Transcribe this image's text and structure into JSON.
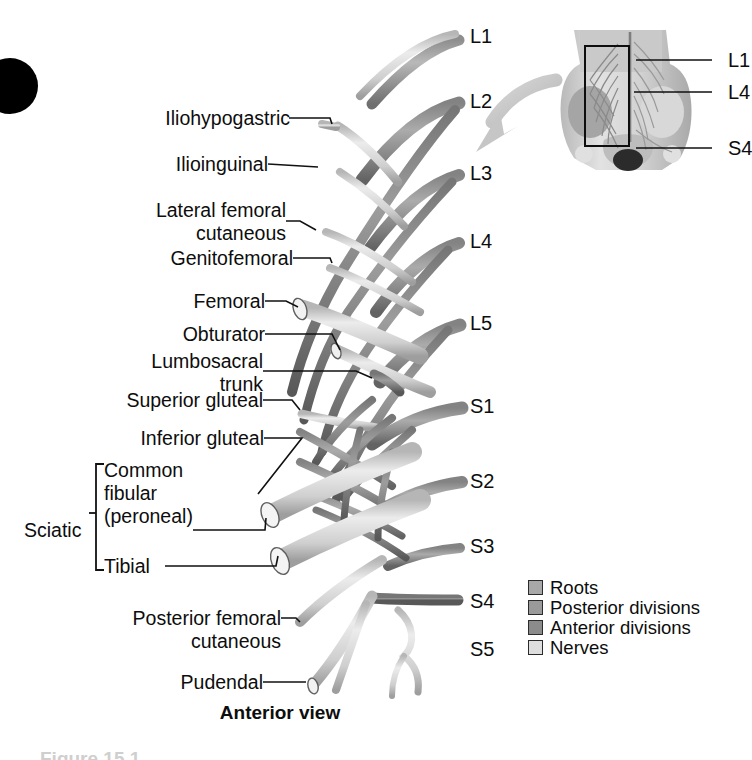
{
  "figure": {
    "view_label": "Anterior view",
    "caption_partial": "Figure 15.1",
    "corner_marker": "black-dot"
  },
  "nerve_labels": [
    {
      "id": "iliohypogastric",
      "text": "Iliohypogastric",
      "x": 142,
      "y": 118,
      "w": 160,
      "lines": 1
    },
    {
      "id": "ilioinguinal",
      "text": "Ilioinguinal",
      "x": 142,
      "y": 164,
      "w": 160,
      "lines": 1
    },
    {
      "id": "lateral-femoral-cutaneous",
      "text": "Lateral femoral\ncutaneous",
      "x": 110,
      "y": 210,
      "w": 192,
      "lines": 2
    },
    {
      "id": "genitofemoral",
      "text": "Genitofemoral",
      "x": 122,
      "y": 258,
      "w": 180,
      "lines": 1
    },
    {
      "id": "femoral",
      "text": "Femoral",
      "x": 130,
      "y": 301,
      "w": 142,
      "lines": 1
    },
    {
      "id": "obturator",
      "text": "Obturator",
      "x": 122,
      "y": 334,
      "w": 150,
      "lines": 1
    },
    {
      "id": "lumbosacral-trunk",
      "text": "Lumbosacral\ntrunk",
      "x": 108,
      "y": 361,
      "w": 164,
      "lines": 2
    },
    {
      "id": "superior-gluteal",
      "text": "Superior gluteal",
      "x": 82,
      "y": 400,
      "w": 190,
      "lines": 1
    },
    {
      "id": "inferior-gluteal",
      "text": "Inferior gluteal",
      "x": 88,
      "y": 438,
      "w": 184,
      "lines": 1
    },
    {
      "id": "common-fibular-peroneal",
      "text": "Common\nfibular\n(peroneal)",
      "x": 104,
      "y": 470,
      "w": 120,
      "lines": 3
    },
    {
      "id": "sciatic",
      "text": "Sciatic",
      "x": 30,
      "y": 513,
      "w": 66,
      "lines": 1
    },
    {
      "id": "tibial",
      "text": "Tibial",
      "x": 104,
      "y": 551,
      "w": 70,
      "lines": 1
    },
    {
      "id": "posterior-femoral-cutaneous",
      "text": "Posterior femoral\ncutaneous",
      "x": 78,
      "y": 610,
      "w": 208,
      "lines": 2
    },
    {
      "id": "pudendal",
      "text": "Pudendal",
      "x": 130,
      "y": 682,
      "w": 142,
      "lines": 1
    }
  ],
  "spinal_levels": [
    {
      "id": "L1",
      "text": "L1",
      "x": 470,
      "y": 25
    },
    {
      "id": "L2",
      "text": "L2",
      "x": 470,
      "y": 90
    },
    {
      "id": "L3",
      "text": "L3",
      "x": 470,
      "y": 162
    },
    {
      "id": "L4",
      "text": "L4",
      "x": 470,
      "y": 230
    },
    {
      "id": "L5",
      "text": "L5",
      "x": 470,
      "y": 312
    },
    {
      "id": "S1",
      "text": "S1",
      "x": 470,
      "y": 395
    },
    {
      "id": "S2",
      "text": "S2",
      "x": 470,
      "y": 470
    },
    {
      "id": "S3",
      "text": "S3",
      "x": 470,
      "y": 535
    },
    {
      "id": "S4",
      "text": "S4",
      "x": 470,
      "y": 590
    },
    {
      "id": "S5",
      "text": "S5",
      "x": 470,
      "y": 638
    }
  ],
  "inset": {
    "name": "pelvis-orientation-inset",
    "levels": [
      {
        "id": "inset-L1",
        "text": "L1",
        "x": 178,
        "y": 32
      },
      {
        "id": "inset-L4",
        "text": "L4",
        "x": 178,
        "y": 64
      },
      {
        "id": "inset-S4",
        "text": "S4",
        "x": 178,
        "y": 120
      }
    ]
  },
  "legend": {
    "items": [
      {
        "id": "roots",
        "label": "Roots",
        "color": "#a8a8a8"
      },
      {
        "id": "posterior-divisions",
        "label": "Posterior divisions",
        "color": "#9a9a9a"
      },
      {
        "id": "anterior-divisions",
        "label": "Anterior divisions",
        "color": "#8b8b8b"
      },
      {
        "id": "nerves",
        "label": "Nerves",
        "color": "#dedede"
      }
    ]
  },
  "colors": {
    "roots": "#a8a8a8",
    "posterior_divisions": "#9a9a9a",
    "anterior_divisions": "#8b8b8b",
    "nerves": "#dedede",
    "leader_line": "#111111",
    "background": "#ffffff",
    "arrow": "#c2c2c2"
  }
}
